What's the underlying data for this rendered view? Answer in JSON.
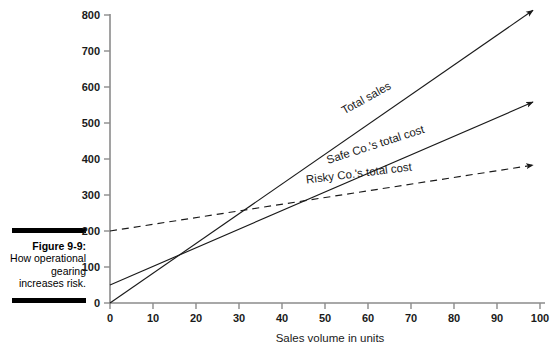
{
  "figure": {
    "caption_label": "Figure 9-9:",
    "caption_body": "How operational gearing increases risk."
  },
  "chart_data": {
    "type": "line",
    "title": "",
    "xlabel": "Sales volume in units",
    "ylabel": "",
    "xlim": [
      0,
      100
    ],
    "ylim": [
      0,
      800
    ],
    "x_ticks": [
      0,
      10,
      20,
      30,
      40,
      50,
      60,
      70,
      80,
      90,
      100
    ],
    "x_tick_labels": [
      "0",
      "10",
      "20",
      "30",
      "40",
      "50",
      "60",
      "70",
      "80",
      "90",
      "100"
    ],
    "y_ticks": [
      0,
      100,
      200,
      300,
      400,
      500,
      600,
      700,
      800
    ],
    "y_tick_labels": [
      "0",
      "100",
      "200",
      "300",
      "400",
      "500",
      "600",
      "700",
      "800"
    ],
    "grid": false,
    "legend_position": "inline-labels",
    "axis_color": "#8b8b8b",
    "line_color": "#1a1a1a",
    "series": [
      {
        "name": "Total sales",
        "style": "solid",
        "x": [
          0,
          100
        ],
        "values": [
          0,
          800
        ],
        "label": "Total sales",
        "label_x": 60,
        "label_y": 560,
        "label_rotation": -29
      },
      {
        "name": "Safe Co.'s total cost",
        "style": "solid",
        "x": [
          0,
          100
        ],
        "values": [
          50,
          550
        ],
        "label": "Safe Co.'s total cost",
        "label_x": 62,
        "label_y": 430,
        "label_rotation": -18
      },
      {
        "name": "Risky Co.'s total cost",
        "style": "dashed",
        "x": [
          0,
          100
        ],
        "values": [
          200,
          380
        ],
        "label": "Risky Co.'s total cost",
        "label_x": 58,
        "label_y": 350,
        "label_rotation": -7
      }
    ],
    "intersections": [
      {
        "between": [
          "Total sales",
          "Safe Co.'s total cost"
        ],
        "x": 16.7,
        "y": 133
      },
      {
        "between": [
          "Total sales",
          "Risky Co.'s total cost"
        ],
        "x": 32.3,
        "y": 258
      },
      {
        "between": [
          "Safe Co.'s total cost",
          "Risky Co.'s total cost"
        ],
        "x": 46.9,
        "y": 284
      }
    ]
  }
}
